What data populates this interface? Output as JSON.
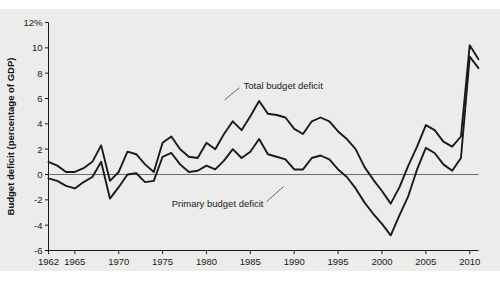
{
  "chart_data": {
    "type": "line",
    "title": "",
    "subtitle": "",
    "xlabel": "",
    "ylabel": "Budget deficit (percentage of GDP)",
    "xlim": [
      1962,
      2011
    ],
    "ylim": [
      -6,
      12
    ],
    "grid": false,
    "legend_position": "inline-annotation",
    "y_ticks": [
      -6,
      -4,
      -2,
      0,
      2,
      4,
      6,
      8,
      10,
      12
    ],
    "y_tick_labels": [
      "-6",
      "-4",
      "-2",
      "0",
      "2",
      "4",
      "6",
      "8",
      "10",
      "12%"
    ],
    "x_ticks": [
      1962,
      1965,
      1970,
      1975,
      1980,
      1985,
      1990,
      1995,
      2000,
      2005,
      2010
    ],
    "x_tick_labels": [
      "1962",
      "1965",
      "1970",
      "1975",
      "1980",
      "1985",
      "1990",
      "1995",
      "2000",
      "2005",
      "2010"
    ],
    "zero_line": 0,
    "x": [
      1962,
      1963,
      1964,
      1965,
      1966,
      1967,
      1968,
      1969,
      1970,
      1971,
      1972,
      1973,
      1974,
      1975,
      1976,
      1977,
      1978,
      1979,
      1980,
      1981,
      1982,
      1983,
      1984,
      1985,
      1986,
      1987,
      1988,
      1989,
      1990,
      1991,
      1992,
      1993,
      1994,
      1995,
      1996,
      1997,
      1998,
      1999,
      2000,
      2001,
      2002,
      2003,
      2004,
      2005,
      2006,
      2007,
      2008,
      2009,
      2010,
      2011
    ],
    "series": [
      {
        "name": "Total budget deficit",
        "color": "#1a1a1a",
        "values": [
          1.0,
          0.7,
          0.2,
          0.2,
          0.5,
          1.0,
          2.3,
          -0.5,
          0.2,
          1.8,
          1.6,
          0.8,
          0.2,
          2.5,
          3.0,
          2.0,
          1.4,
          1.3,
          2.5,
          2.0,
          3.2,
          4.2,
          3.5,
          4.6,
          5.8,
          4.8,
          4.7,
          4.5,
          3.6,
          3.2,
          4.2,
          4.5,
          4.2,
          3.4,
          2.8,
          2.0,
          0.6,
          -0.4,
          -1.3,
          -2.3,
          -1.0,
          0.7,
          2.2,
          3.9,
          3.5,
          2.6,
          2.2,
          3.0,
          10.2,
          9.1
        ],
        "annotation": {
          "text": "Total budget deficit",
          "x": 1984.0,
          "y": 7.0
        }
      },
      {
        "name": "Primary budget deficit",
        "color": "#1a1a1a",
        "values": [
          -0.3,
          -0.5,
          -0.9,
          -1.1,
          -0.6,
          -0.2,
          1.0,
          -1.9,
          -1.0,
          0.0,
          0.1,
          -0.6,
          -0.5,
          1.4,
          1.7,
          0.8,
          0.2,
          0.3,
          0.7,
          0.4,
          1.1,
          2.0,
          1.3,
          1.8,
          2.8,
          1.6,
          1.4,
          1.2,
          0.4,
          0.4,
          1.3,
          1.5,
          1.2,
          0.4,
          -0.2,
          -1.1,
          -2.2,
          -3.1,
          -3.9,
          -4.8,
          -3.2,
          -1.7,
          0.4,
          2.1,
          1.7,
          0.8,
          0.3,
          1.3,
          9.3,
          8.4
        ],
        "annotation": {
          "text": "Primary budget deficit",
          "x": 1986.5,
          "y": -2.3
        }
      }
    ]
  },
  "annotations": {
    "total_label": "Total budget deficit",
    "primary_label": "Primary budget deficit"
  },
  "axes": {
    "y_axis_title": "Budget deficit (percentage of GDP)"
  },
  "colors": {
    "line": "#1a1a1a",
    "axis": "#1a1a1a",
    "panel_background": "#ececeb",
    "figure_background": "#ffffff",
    "zero_line": "#6b6b6b"
  }
}
